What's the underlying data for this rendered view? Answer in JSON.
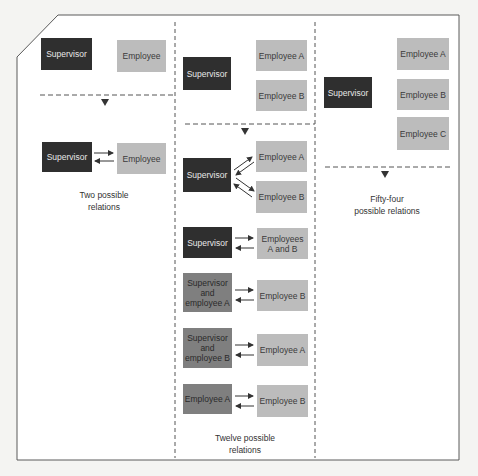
{
  "diagram": {
    "colors": {
      "supervisor": "#2f2f2f",
      "employee": "#bcbcbc",
      "combined": "#7f7f7f",
      "frame": "#555555",
      "background": "#f4f4f2"
    },
    "panels": [
      {
        "id": "two-person",
        "before": {
          "supervisor": "Supervisor",
          "employees": [
            "Employee"
          ]
        },
        "after": [
          {
            "from": "Supervisor",
            "to": "Employee"
          }
        ],
        "caption": "Two possible\nrelations"
      },
      {
        "id": "three-person",
        "before": {
          "supervisor": "Supervisor",
          "employees": [
            "Employee A",
            "Employee B"
          ]
        },
        "after": [
          {
            "from": "Supervisor",
            "to": [
              "Employee A",
              "Employee B"
            ]
          },
          {
            "from": "Supervisor",
            "to": "Employees\nA and B"
          },
          {
            "from": "Supervisor\nand\nemployee A",
            "to": "Employee B"
          },
          {
            "from": "Supervisor\nand\nemployee B",
            "to": "Employee A"
          },
          {
            "from": "Employee A",
            "to": "Employee B"
          }
        ],
        "caption": "Twelve possible\nrelations"
      },
      {
        "id": "four-person",
        "before": {
          "supervisor": "Supervisor",
          "employees": [
            "Employee A",
            "Employee B",
            "Employee C"
          ]
        },
        "caption": "Fifty-four\npossible relations"
      }
    ]
  }
}
